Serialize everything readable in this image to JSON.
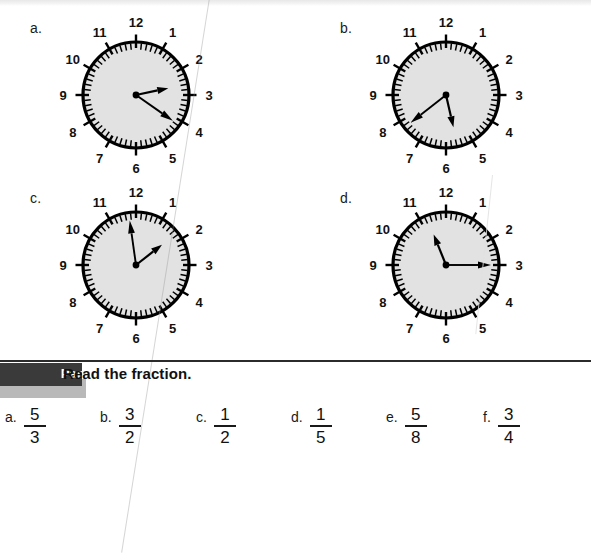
{
  "page": {
    "background_color": "#ffffff",
    "ink_color": "#111111"
  },
  "clock_section": {
    "dial_fill": "#e2e2e2",
    "rim_color": "#000000",
    "hand_color": "#000000",
    "hour_numerals": [
      "12",
      "1",
      "2",
      "3",
      "4",
      "5",
      "6",
      "7",
      "8",
      "9",
      "10",
      "11"
    ],
    "clocks": [
      {
        "letter": "a.",
        "hour_hand_angle_deg": 78,
        "minute_hand_angle_deg": 125,
        "reads_hour": 2,
        "reads_minute": 21
      },
      {
        "letter": "b.",
        "hour_hand_angle_deg": 167,
        "minute_hand_angle_deg": 232,
        "reads_hour": 5,
        "reads_minute": 39
      },
      {
        "letter": "c.",
        "hour_hand_angle_deg": 52,
        "minute_hand_angle_deg": 352,
        "reads_hour": 1,
        "reads_minute": 59
      },
      {
        "letter": "d.",
        "hour_hand_angle_deg": 338,
        "minute_hand_angle_deg": 90,
        "reads_hour": 11,
        "reads_minute": 15
      }
    ]
  },
  "part_header": {
    "badge_label": "Part 2",
    "instruction": "Read the fraction.",
    "badge_color": "#3a3a3a",
    "badge_text_color": "#ffffff",
    "rule_color": "#2b2b2b"
  },
  "fractions": {
    "items": [
      {
        "letter": "a.",
        "numerator": "5",
        "denominator": "3"
      },
      {
        "letter": "b.",
        "numerator": "3",
        "denominator": "2"
      },
      {
        "letter": "c.",
        "numerator": "1",
        "denominator": "2"
      },
      {
        "letter": "d.",
        "numerator": "1",
        "denominator": "5"
      },
      {
        "letter": "e.",
        "numerator": "5",
        "denominator": "8"
      },
      {
        "letter": "f.",
        "numerator": "3",
        "denominator": "4"
      }
    ]
  }
}
